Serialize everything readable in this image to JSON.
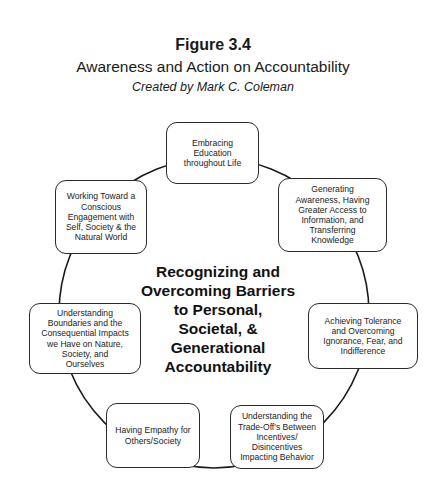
{
  "header": {
    "figure_number": "Figure 3.4",
    "title": "Awareness and Action on Accountability",
    "credit": "Created by Mark C. Coleman"
  },
  "diagram": {
    "type": "cycle",
    "center": {
      "label": "Recognizing and\nOvercoming Barriers\nto Personal,\nSocietal, &\nGenerational\nAccountability"
    },
    "nodes": [
      {
        "id": "top",
        "label": "Embracing\nEducation\nthroughout Life"
      },
      {
        "id": "top-right",
        "label": "Generating\nAwareness, Having\nGreater Access to\nInformation, and\nTransferring\nKnowledge"
      },
      {
        "id": "right",
        "label": "Achieving Tolerance\nand Overcoming\nIgnorance, Fear, and\nIndifference"
      },
      {
        "id": "bottom-right",
        "label": "Understanding the\nTrade-Off's Between\nIncentives/\nDisincentives\nImpacting Behavior"
      },
      {
        "id": "bottom-left",
        "label": "Having Empathy for\nOthers/Society"
      },
      {
        "id": "left",
        "label": "Understanding\nBoundaries and the\nConsequential Impacts\nwe Have on Nature,\nSociety, and\nOurselves"
      },
      {
        "id": "top-left",
        "label": "Working Toward a\nConscious\nEngagement with\nSelf, Society & the\nNatural World"
      }
    ],
    "colors": {
      "line": "#1a1a1a",
      "box_border": "#2a2a2a",
      "background": "#ffffff"
    }
  }
}
